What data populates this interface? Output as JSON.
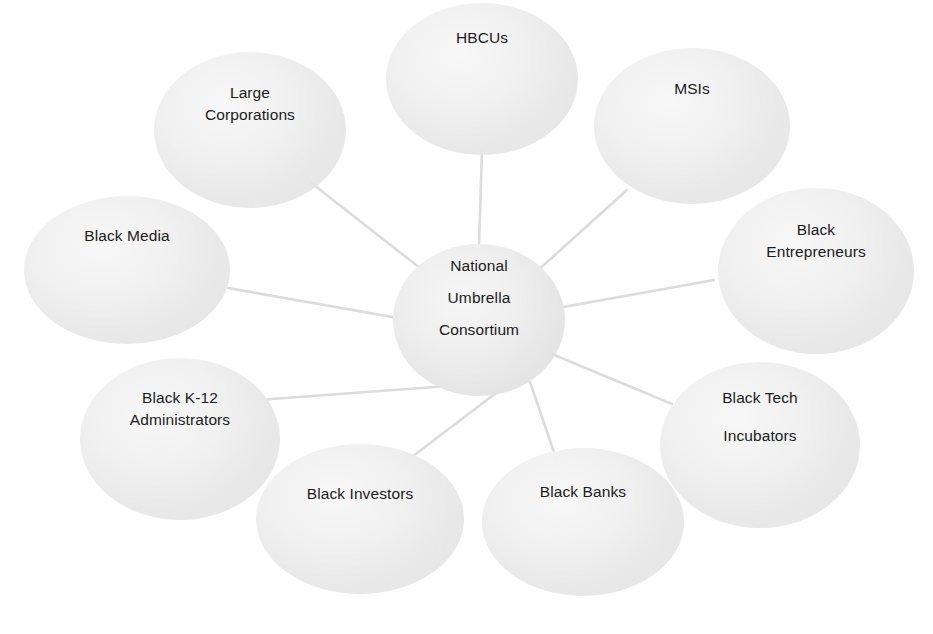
{
  "diagram": {
    "title": "National Umbrella Consortium",
    "type": "hub-and-spoke",
    "background_color": "#ffffff",
    "node_fill_color": "#ededed",
    "edge_color": "#dcdcdc",
    "text_color": "#1b1b1b",
    "center": {
      "id": "national-umbrella-consortium",
      "lines": [
        "National",
        "Umbrella",
        "Consortium"
      ]
    },
    "satellites": [
      {
        "id": "hbcus",
        "lines": [
          "HBCUs"
        ]
      },
      {
        "id": "msis",
        "lines": [
          "MSIs"
        ]
      },
      {
        "id": "large-corporations",
        "lines": [
          "Large",
          "Corporations"
        ]
      },
      {
        "id": "black-media",
        "lines": [
          "Black Media"
        ]
      },
      {
        "id": "black-entrepreneurs",
        "lines": [
          "Black",
          "Entrepreneurs"
        ]
      },
      {
        "id": "black-k12-administrators",
        "lines": [
          "Black K-12",
          "Administrators"
        ]
      },
      {
        "id": "black-tech-incubators",
        "lines": [
          "Black Tech",
          "Incubators"
        ]
      },
      {
        "id": "black-investors",
        "lines": [
          "Black Investors"
        ]
      },
      {
        "id": "black-banks",
        "lines": [
          "Black Banks"
        ]
      }
    ],
    "edges": [
      {
        "from": "national-umbrella-consortium",
        "to": "hbcus"
      },
      {
        "from": "national-umbrella-consortium",
        "to": "msis"
      },
      {
        "from": "national-umbrella-consortium",
        "to": "large-corporations"
      },
      {
        "from": "national-umbrella-consortium",
        "to": "black-media"
      },
      {
        "from": "national-umbrella-consortium",
        "to": "black-entrepreneurs"
      },
      {
        "from": "national-umbrella-consortium",
        "to": "black-k12-administrators"
      },
      {
        "from": "national-umbrella-consortium",
        "to": "black-tech-incubators"
      },
      {
        "from": "national-umbrella-consortium",
        "to": "black-investors"
      },
      {
        "from": "national-umbrella-consortium",
        "to": "black-banks"
      }
    ]
  }
}
